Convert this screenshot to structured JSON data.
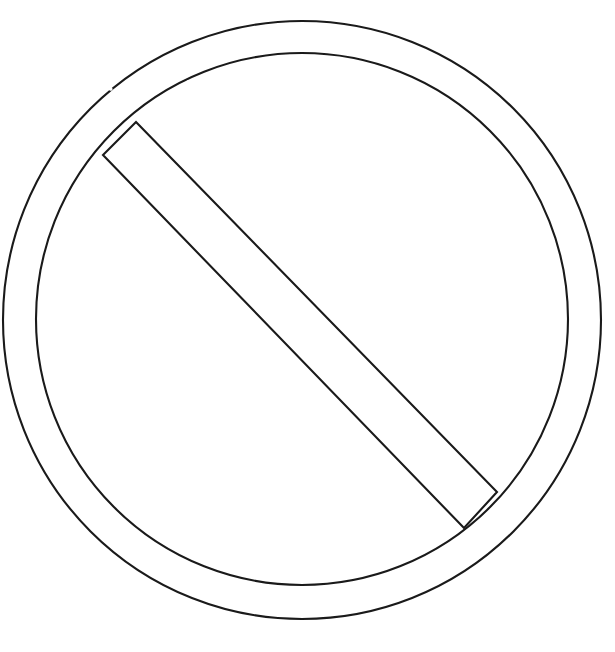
{
  "document": {
    "title": "Prohibition Sign Outline",
    "subject": "no-entry-sign",
    "style": "line-art coloring page",
    "background_color": "#ffffff",
    "stroke_color": "#1a1a1a",
    "stroke_width_px": 2,
    "canvas": {
      "width": 615,
      "height": 652
    }
  },
  "artwork": {
    "name": "no-symbol",
    "description": "Circle with slash — prohibition / no entry sign drawn as an unfilled outline",
    "shapes": [
      {
        "name": "outer-circle",
        "type": "circle",
        "cx": 302,
        "cy": 320,
        "r": 299
      },
      {
        "name": "inner-circle",
        "type": "circle",
        "cx": 302,
        "cy": 319,
        "r": 266
      },
      {
        "name": "diagonal-bar",
        "type": "polygon",
        "bar_width_px": 33,
        "angle_deg": 45,
        "vertices": [
          {
            "name": "top-left-outer",
            "x": 136,
            "y": 122
          },
          {
            "name": "bottom-right-outer",
            "x": 497,
            "y": 492
          },
          {
            "name": "bottom-right-inner",
            "x": 464,
            "y": 528
          },
          {
            "name": "top-left-inner",
            "x": 103,
            "y": 155
          }
        ]
      }
    ],
    "line_gaps": [
      {
        "name": "gap-outer-upper-left",
        "x": 108,
        "y": 88
      },
      {
        "name": "gap-inner-upper-left",
        "x": 191,
        "y": 83
      },
      {
        "name": "gap-inner-upper-right",
        "x": 435,
        "y": 93
      },
      {
        "name": "gap-outer-upper-right",
        "x": 512,
        "y": 99
      }
    ]
  }
}
